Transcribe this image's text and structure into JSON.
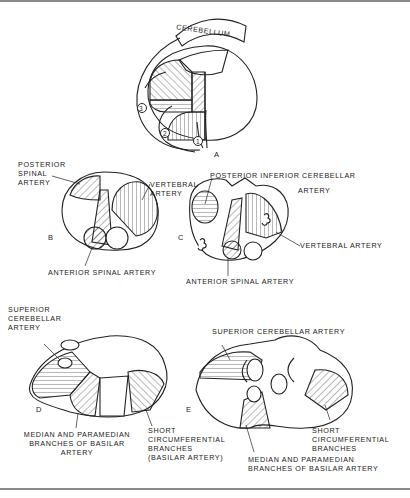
{
  "figure": {
    "panels": {
      "A": {
        "letter": "A",
        "cerebellum_label": "CEREBELLUM",
        "pathway_numbers": [
          "1",
          "2",
          "3"
        ]
      },
      "B": {
        "letter": "B",
        "labels": {
          "posterior_spinal": "POSTERIOR\nSPINAL\nARTERY",
          "vertebral": "VERTEBRAL\nARTERY",
          "anterior_spinal": "ANTERIOR SPINAL ARTERY"
        }
      },
      "C": {
        "letter": "C",
        "labels": {
          "pica_line1": "POSTERIOR INFERIOR CEREBELLAR",
          "pica_line2": "ARTERY",
          "vertebral": "VERTEBRAL ARTERY",
          "anterior_spinal": "ANTERIOR SPINAL ARTERY"
        }
      },
      "D": {
        "letter": "D",
        "labels": {
          "superior_cerebellar": "SUPERIOR\nCEREBELLAR\nARTERY",
          "median_paramedian": "MEDIAN AND PARAMEDIAN\nBRANCHES OF BASILAR\nARTERY",
          "short_circumferential": "SHORT\nCIRCUMFERENTIAL\nBRANCHES\n(BASILAR ARTERY)"
        }
      },
      "E": {
        "letter": "E",
        "labels": {
          "superior_cerebellar": "SUPERIOR CEREBELLAR ARTERY",
          "short_circumferential": "SHORT\nCIRCUMFERENTIAL\nBRANCHES",
          "median_paramedian": "MEDIAN AND PARAMEDIAN\nBRANCHES OF BASILAR ARTERY"
        }
      }
    }
  }
}
